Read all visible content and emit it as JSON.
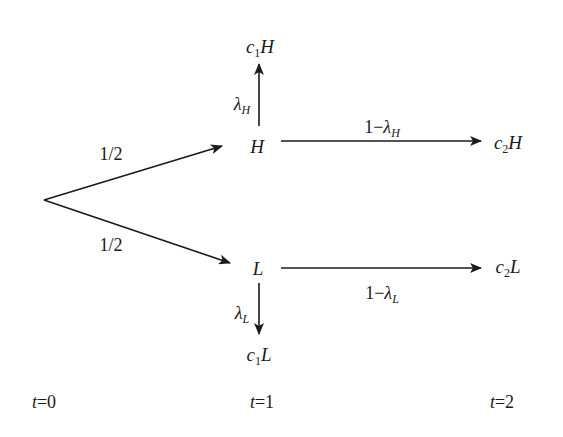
{
  "diagram": {
    "type": "probability-tree",
    "colors": {
      "line": "#1a1a1a",
      "background": "#ffffff"
    },
    "root": {
      "label": "",
      "x": 44,
      "y": 200
    },
    "branches": {
      "to_H": {
        "prob": "1/2"
      },
      "to_L": {
        "prob": "1/2"
      }
    },
    "nodes": {
      "H": {
        "label": "H"
      },
      "L": {
        "label": "L"
      },
      "c1H": {
        "coef": "c",
        "sub": "1",
        "state": "H"
      },
      "c2H": {
        "coef": "c",
        "sub": "2",
        "state": "H"
      },
      "c1L": {
        "coef": "c",
        "sub": "1",
        "state": "L"
      },
      "c2L": {
        "coef": "c",
        "sub": "2",
        "state": "L"
      }
    },
    "edges": {
      "H_to_c1H": {
        "symbol": "λ",
        "sub": "H"
      },
      "H_to_c2H": {
        "prefix": "1−",
        "symbol": "λ",
        "sub": "H"
      },
      "L_to_c1L": {
        "symbol": "λ",
        "sub": "L"
      },
      "L_to_c2L": {
        "prefix": "1−",
        "symbol": "λ",
        "sub": "L"
      }
    },
    "time_labels": [
      {
        "var": "t",
        "eq": "=0"
      },
      {
        "var": "t",
        "eq": "=1"
      },
      {
        "var": "t",
        "eq": "=2"
      }
    ]
  }
}
